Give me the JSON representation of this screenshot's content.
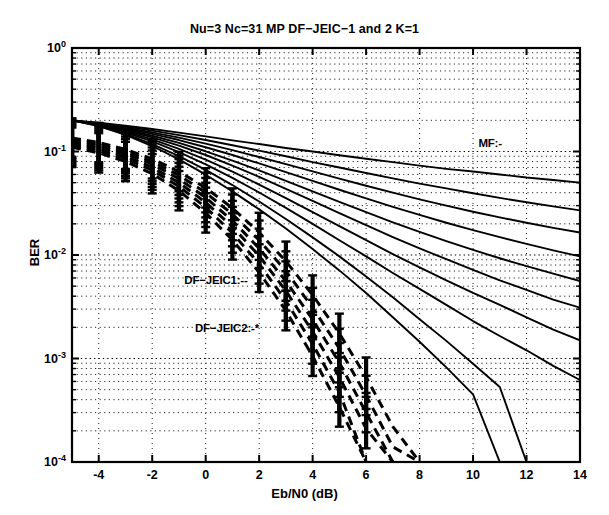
{
  "chart_data": {
    "type": "line",
    "title": "Nu=3 Nc=31 MP DF−JEIC−1 and 2 K=1",
    "xlabel": "Eb/N0 (dB)",
    "ylabel": "BER",
    "xlim": [
      -5,
      14
    ],
    "ylim": [
      0.0001,
      1
    ],
    "yscale": "log",
    "grid": true,
    "xticks": [
      -4,
      -2,
      0,
      2,
      4,
      6,
      8,
      10,
      12,
      14
    ],
    "xticklabels": [
      "-4",
      "-2",
      "0",
      "2",
      "4",
      "6",
      "8",
      "10",
      "12",
      "14"
    ],
    "yticks": [
      1,
      0.1,
      0.01,
      0.001,
      0.0001
    ],
    "yticklabels": [
      "10",
      "10",
      "10",
      "10",
      "10"
    ],
    "yticklabel_exponents": [
      "0",
      "-1",
      "-2",
      "-3",
      "-4"
    ],
    "annotations": [
      {
        "text": "MF:-",
        "x": 10.2,
        "y": 0.115
      },
      {
        "text": "DF−JEIC1:--",
        "x": -0.8,
        "y": 0.0055
      },
      {
        "text": "DF−JEIC2:-*",
        "x": -0.4,
        "y": 0.0019
      }
    ],
    "legend_position": "inline-annotations",
    "series": [
      {
        "name": "MF 1",
        "style": "solid",
        "x": [
          -5,
          -4,
          -3,
          -2,
          -1,
          0,
          1,
          2,
          3,
          4,
          5,
          6,
          7,
          8,
          9,
          10,
          11,
          12,
          13,
          14
        ],
        "y": [
          0.2,
          0.19,
          0.178,
          0.165,
          0.152,
          0.14,
          0.128,
          0.118,
          0.108,
          0.1,
          0.092,
          0.085,
          0.079,
          0.073,
          0.068,
          0.064,
          0.06,
          0.056,
          0.053,
          0.05
        ]
      },
      {
        "name": "MF 2",
        "style": "solid",
        "x": [
          -5,
          -4,
          -3,
          -2,
          -1,
          0,
          1,
          2,
          3,
          4,
          5,
          6,
          7,
          8,
          9,
          10,
          11,
          12,
          13,
          14
        ],
        "y": [
          0.2,
          0.188,
          0.174,
          0.159,
          0.144,
          0.129,
          0.115,
          0.102,
          0.09,
          0.079,
          0.07,
          0.062,
          0.055,
          0.049,
          0.044,
          0.0395,
          0.0356,
          0.0323,
          0.0295,
          0.027
        ]
      },
      {
        "name": "MF 3",
        "style": "solid",
        "x": [
          -5,
          -4,
          -3,
          -2,
          -1,
          0,
          1,
          2,
          3,
          4,
          5,
          6,
          7,
          8,
          9,
          10,
          11,
          12,
          13,
          14
        ],
        "y": [
          0.2,
          0.186,
          0.17,
          0.153,
          0.136,
          0.119,
          0.103,
          0.0885,
          0.0755,
          0.0643,
          0.0547,
          0.0467,
          0.04,
          0.0345,
          0.03,
          0.0262,
          0.0231,
          0.0205,
          0.0183,
          0.0165
        ]
      },
      {
        "name": "MF 4",
        "style": "solid",
        "x": [
          -5,
          -4,
          -3,
          -2,
          -1,
          0,
          1,
          2,
          3,
          4,
          5,
          6,
          7,
          8,
          9,
          10,
          11,
          12,
          13,
          14
        ],
        "y": [
          0.2,
          0.185,
          0.167,
          0.148,
          0.129,
          0.11,
          0.0925,
          0.0768,
          0.0633,
          0.052,
          0.0427,
          0.0352,
          0.0292,
          0.0244,
          0.0205,
          0.0174,
          0.0149,
          0.0128,
          0.0111,
          0.0097
        ]
      },
      {
        "name": "MF 5",
        "style": "solid",
        "x": [
          -5,
          -4,
          -3,
          -2,
          -1,
          0,
          1,
          2,
          3,
          4,
          5,
          6,
          7,
          8,
          9,
          10,
          11,
          12,
          13,
          14
        ],
        "y": [
          0.2,
          0.183,
          0.163,
          0.142,
          0.121,
          0.1005,
          0.0818,
          0.0656,
          0.0521,
          0.0412,
          0.0326,
          0.0259,
          0.0207,
          0.0167,
          0.0136,
          0.0112,
          0.0093,
          0.0078,
          0.0066,
          0.0056
        ]
      },
      {
        "name": "MF 6",
        "style": "solid",
        "x": [
          -5,
          -4,
          -3,
          -2,
          -1,
          0,
          1,
          2,
          3,
          4,
          5,
          6,
          7,
          8,
          9,
          10,
          11,
          12,
          13,
          14
        ],
        "y": [
          0.2,
          0.182,
          0.16,
          0.137,
          0.114,
          0.0925,
          0.0731,
          0.0568,
          0.0436,
          0.0333,
          0.0254,
          0.0194,
          0.0149,
          0.0116,
          0.0091,
          0.0072,
          0.0057,
          0.0046,
          0.0037,
          0.0031
        ]
      },
      {
        "name": "MF 7",
        "style": "solid",
        "x": [
          -5,
          -4,
          -3,
          -2,
          -1,
          0,
          1,
          2,
          3,
          4,
          5,
          6,
          7,
          8,
          9,
          10,
          11,
          12,
          13,
          14
        ],
        "y": [
          0.2,
          0.18,
          0.156,
          0.131,
          0.106,
          0.0836,
          0.0639,
          0.0479,
          0.0354,
          0.026,
          0.019,
          0.0139,
          0.0102,
          0.0076,
          0.0057,
          0.0043,
          0.0033,
          0.0025,
          0.0019,
          0.0015
        ]
      },
      {
        "name": "MF 8",
        "style": "solid",
        "x": [
          -5,
          -4,
          -3,
          -2,
          -1,
          0,
          1,
          2,
          3,
          4,
          5,
          6,
          7,
          8,
          9,
          10,
          11,
          12,
          13,
          14
        ],
        "y": [
          0.2,
          0.179,
          0.152,
          0.125,
          0.0985,
          0.0752,
          0.0557,
          0.0402,
          0.0285,
          0.02,
          0.0139,
          0.0097,
          0.0067,
          0.0047,
          0.0033,
          0.0023,
          0.00165,
          0.0012,
          0.00085,
          0.00062
        ]
      },
      {
        "name": "MF 9",
        "style": "solid",
        "x": [
          -5,
          -4,
          -3,
          -2,
          -1,
          0,
          1,
          2,
          3,
          4,
          5,
          6,
          7,
          8,
          9,
          10,
          11,
          12
        ],
        "y": [
          0.2,
          0.177,
          0.148,
          0.118,
          0.0902,
          0.0664,
          0.0474,
          0.0329,
          0.0223,
          0.0148,
          0.0097,
          0.0062,
          0.0039,
          0.0024,
          0.00148,
          0.00089,
          0.00053,
          0.0001
        ]
      },
      {
        "name": "MF 10",
        "style": "solid",
        "x": [
          -5,
          -4,
          -3,
          -2,
          -1,
          0,
          1,
          2,
          3,
          4,
          5,
          6,
          7,
          8,
          9,
          10,
          11
        ],
        "y": [
          0.2,
          0.176,
          0.145,
          0.113,
          0.0838,
          0.0597,
          0.0412,
          0.0276,
          0.018,
          0.0114,
          0.0071,
          0.0043,
          0.0025,
          0.00145,
          0.00082,
          0.00045,
          0.0001
        ]
      },
      {
        "name": "DF-JEIC1 a",
        "style": "dashed",
        "x": [
          -5,
          -4,
          -3,
          -2,
          -1,
          0,
          1,
          2,
          3,
          4,
          5,
          6,
          7,
          8
        ],
        "y": [
          0.135,
          0.122,
          0.105,
          0.085,
          0.064,
          0.0445,
          0.0284,
          0.0165,
          0.0087,
          0.0041,
          0.00175,
          0.00066,
          0.00022,
          0.0001
        ]
      },
      {
        "name": "DF-JEIC1 b",
        "style": "dashed",
        "x": [
          -5,
          -4,
          -3,
          -2,
          -1,
          0,
          1,
          2,
          3,
          4,
          5,
          6,
          7,
          8
        ],
        "y": [
          0.13,
          0.117,
          0.1,
          0.08,
          0.059,
          0.04,
          0.0248,
          0.0139,
          0.007,
          0.0031,
          0.00125,
          0.00044,
          0.00014,
          0.0001
        ]
      },
      {
        "name": "DF-JEIC1 c",
        "style": "dashed",
        "x": [
          -5,
          -4,
          -3,
          -2,
          -1,
          0,
          1,
          2,
          3,
          4,
          5,
          6,
          7
        ],
        "y": [
          0.125,
          0.112,
          0.0955,
          0.0755,
          0.0545,
          0.0358,
          0.0215,
          0.0116,
          0.0056,
          0.00238,
          0.00091,
          0.0003,
          0.0001
        ]
      },
      {
        "name": "DF-JEIC2 a",
        "style": "dashed",
        "x": [
          -5,
          -4,
          -3,
          -2,
          -1,
          0,
          1,
          2,
          3,
          4,
          5,
          6,
          7
        ],
        "y": [
          0.12,
          0.107,
          0.09,
          0.0705,
          0.05,
          0.0322,
          0.0188,
          0.0098,
          0.0045,
          0.00182,
          0.00066,
          0.00021,
          0.0001
        ]
      },
      {
        "name": "DF-JEIC2 b",
        "style": "dashed",
        "x": [
          -5,
          -4,
          -3,
          -2,
          -1,
          0,
          1,
          2,
          3,
          4,
          5,
          6
        ],
        "y": [
          0.115,
          0.102,
          0.0853,
          0.066,
          0.046,
          0.0289,
          0.0163,
          0.0082,
          0.0036,
          0.00138,
          0.00047,
          0.0001
        ]
      },
      {
        "name": "DF-JEIC2 c",
        "style": "dashed",
        "x": [
          -5,
          -4,
          -3,
          -2,
          -1,
          0,
          1,
          2,
          3,
          4,
          5,
          6
        ],
        "y": [
          0.11,
          0.097,
          0.08,
          0.061,
          0.0418,
          0.0255,
          0.014,
          0.0068,
          0.0029,
          0.00105,
          0.00034,
          0.0001
        ]
      }
    ],
    "errorbars": {
      "description": "vertical error bars on dashed DF-JEIC curves",
      "x": [
        -5,
        -4,
        -3,
        -2,
        -1,
        0,
        1,
        2,
        3,
        4,
        5,
        6
      ]
    }
  },
  "colors": {
    "foreground": "#000000",
    "background": "#ffffff",
    "grid": "#000000"
  }
}
